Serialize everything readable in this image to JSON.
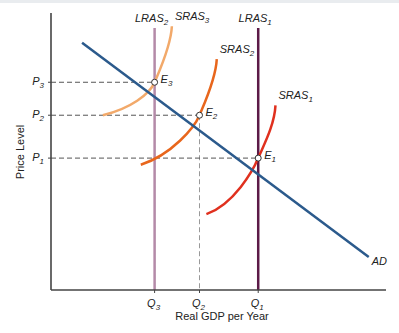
{
  "chart_data": {
    "type": "line",
    "title": "",
    "xlabel": "Real GDP per Year",
    "ylabel": "Price Level",
    "grid": false,
    "x_ticks": [
      {
        "base": "Q",
        "sub": "3",
        "value": 3
      },
      {
        "base": "Q",
        "sub": "2",
        "value": 4.3
      },
      {
        "base": "Q",
        "sub": "1",
        "value": 6
      }
    ],
    "y_ticks": [
      {
        "base": "P",
        "sub": "3",
        "value": 6.3
      },
      {
        "base": "P",
        "sub": "2",
        "value": 5.3
      },
      {
        "base": "P",
        "sub": "1",
        "value": 4
      }
    ],
    "xlim": [
      0,
      9.7
    ],
    "ylim": [
      0,
      8.4
    ],
    "series": [
      {
        "name": "AD",
        "label_base": "AD",
        "label_sub": "",
        "kind": "line",
        "color": "#2b5a8c",
        "points": [
          [
            0.9,
            7.5
          ],
          [
            9.2,
            1.0
          ]
        ]
      },
      {
        "name": "LRAS2",
        "label_base": "LRAS",
        "label_sub": "2",
        "kind": "vertical",
        "color": "#b48aa8",
        "x": 3
      },
      {
        "name": "LRAS1",
        "label_base": "LRAS",
        "label_sub": "1",
        "kind": "vertical",
        "color": "#5c1a48",
        "x": 6
      },
      {
        "name": "SRAS3",
        "label_base": "SRAS",
        "label_sub": "3",
        "kind": "curve",
        "color": "#f2a96a",
        "points": [
          [
            1.5,
            5.3
          ],
          [
            2.3,
            5.5
          ],
          [
            3.0,
            6.3
          ],
          [
            3.5,
            8.0
          ]
        ]
      },
      {
        "name": "SRAS2",
        "label_base": "SRAS",
        "label_sub": "2",
        "kind": "curve",
        "color": "#e8661c",
        "points": [
          [
            2.6,
            3.8
          ],
          [
            3.5,
            4.1
          ],
          [
            4.3,
            5.3
          ],
          [
            4.8,
            7.0
          ]
        ]
      },
      {
        "name": "SRAS1",
        "label_base": "SRAS",
        "label_sub": "1",
        "kind": "curve",
        "color": "#e0301e",
        "points": [
          [
            4.5,
            2.3
          ],
          [
            5.3,
            2.6
          ],
          [
            6.0,
            4.0
          ],
          [
            6.5,
            5.6
          ]
        ]
      }
    ],
    "equilibria": [
      {
        "base": "E",
        "sub": "3",
        "x": 3,
        "y": 6.3
      },
      {
        "base": "E",
        "sub": "2",
        "x": 4.3,
        "y": 5.3
      },
      {
        "base": "E",
        "sub": "1",
        "x": 6,
        "y": 4
      }
    ]
  }
}
